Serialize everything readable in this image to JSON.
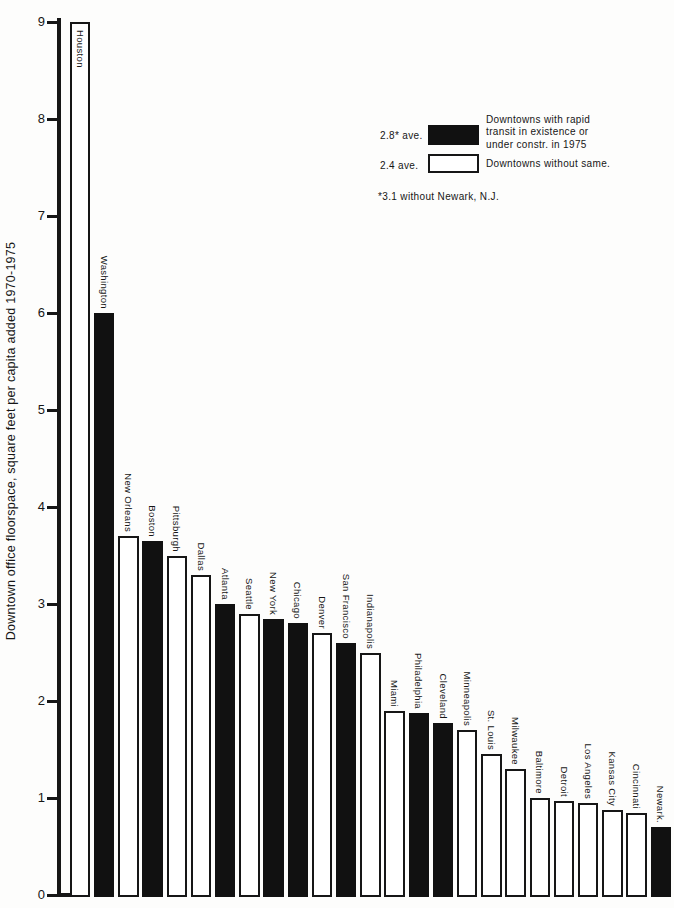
{
  "figure": {
    "background": "#fdfdfc",
    "ink": "#161616",
    "bar_fill_transit": "#111111",
    "bar_fill_no_transit": "#ffffff"
  },
  "y_axis": {
    "title": "Downtown office floorspace, square feet per capita added 1970-1975",
    "ticks": [
      "0",
      "1",
      "2",
      "3",
      "4",
      "5",
      "6",
      "7",
      "8",
      "9"
    ]
  },
  "legend": {
    "black_avg_label": "2.8* ave.",
    "white_avg_label": "2.4 ave.",
    "black_desc_lines": [
      "Downtowns with rapid",
      "transit in existence or",
      "under constr. in 1975"
    ],
    "white_desc": "Downtowns without same.",
    "footnote": "*3.1 without Newark, N.J."
  },
  "chart_data": {
    "type": "bar",
    "title": "",
    "xlabel": "",
    "ylabel": "Downtown office floorspace, square feet per capita added 1970-1975",
    "ylim": [
      0,
      9
    ],
    "grid": false,
    "legend_position": "upper-right",
    "categories": [
      "Houston",
      "Washington",
      "New Orleans",
      "Boston",
      "Pittsburgh",
      "Dallas",
      "Atlanta",
      "Seattle",
      "New York",
      "Chicago",
      "Denver",
      "San Francisco",
      "Indianapolis",
      "Miami",
      "Philadelphia",
      "Cleveland",
      "Minneapolis",
      "St. Louis",
      "Milwaukee",
      "Baltimore",
      "Detroit",
      "Los Angeles",
      "Kansas City",
      "Cincinnati",
      "Newark."
    ],
    "values": [
      9.0,
      6.0,
      3.7,
      3.65,
      3.5,
      3.3,
      3.0,
      2.9,
      2.85,
      2.8,
      2.7,
      2.6,
      2.5,
      1.9,
      1.88,
      1.77,
      1.7,
      1.45,
      1.3,
      1.0,
      0.97,
      0.95,
      0.88,
      0.85,
      0.7
    ],
    "series": [
      {
        "name": "Downtowns with rapid transit in existence or under constr. in 1975",
        "average": "2.8* ave.",
        "color": "#111111"
      },
      {
        "name": "Downtowns without same.",
        "average": "2.4 ave.",
        "color": "#ffffff"
      }
    ],
    "bars": [
      {
        "city": "Houston",
        "value": 9.0,
        "transit": false,
        "label_inside": true
      },
      {
        "city": "Washington",
        "value": 6.0,
        "transit": true
      },
      {
        "city": "New Orleans",
        "value": 3.7,
        "transit": false
      },
      {
        "city": "Boston",
        "value": 3.65,
        "transit": true
      },
      {
        "city": "Pittsburgh",
        "value": 3.5,
        "transit": false
      },
      {
        "city": "Dallas",
        "value": 3.3,
        "transit": false
      },
      {
        "city": "Atlanta",
        "value": 3.0,
        "transit": true
      },
      {
        "city": "Seattle",
        "value": 2.9,
        "transit": false
      },
      {
        "city": "New York",
        "value": 2.85,
        "transit": true
      },
      {
        "city": "Chicago",
        "value": 2.8,
        "transit": true
      },
      {
        "city": "Denver",
        "value": 2.7,
        "transit": false
      },
      {
        "city": "San Francisco",
        "value": 2.6,
        "transit": true
      },
      {
        "city": "Indianapolis",
        "value": 2.5,
        "transit": false
      },
      {
        "city": "Miami",
        "value": 1.9,
        "transit": false
      },
      {
        "city": "Philadelphia",
        "value": 1.88,
        "transit": true
      },
      {
        "city": "Cleveland",
        "value": 1.77,
        "transit": true
      },
      {
        "city": "Minneapolis",
        "value": 1.7,
        "transit": false
      },
      {
        "city": "St. Louis",
        "value": 1.45,
        "transit": false
      },
      {
        "city": "Milwaukee",
        "value": 1.3,
        "transit": false
      },
      {
        "city": "Baltimore",
        "value": 1.0,
        "transit": false
      },
      {
        "city": "Detroit",
        "value": 0.97,
        "transit": false
      },
      {
        "city": "Los Angeles",
        "value": 0.95,
        "transit": false
      },
      {
        "city": "Kansas City",
        "value": 0.88,
        "transit": false
      },
      {
        "city": "Cincinnati",
        "value": 0.85,
        "transit": false
      },
      {
        "city": "Newark.",
        "value": 0.7,
        "transit": true
      }
    ]
  }
}
